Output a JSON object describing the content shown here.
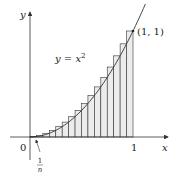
{
  "diagram": {
    "type": "riemann-sum",
    "curve_label": "y = x",
    "curve_exponent": "2",
    "point_label": "(1, 1)",
    "x_axis_label": "x",
    "y_axis_label": "y",
    "origin_label": "0",
    "x_end_label": "1",
    "width_label_num": "1",
    "width_label_den": "n",
    "n_rectangles": 16,
    "colors": {
      "bar_fill": "#ececec",
      "stroke": "#333333"
    }
  }
}
